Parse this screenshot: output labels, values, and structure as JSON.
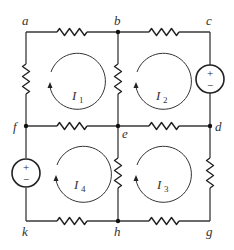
{
  "diagram": {
    "type": "circuit-mesh",
    "nodes": {
      "a": {
        "label": "a",
        "x": 26,
        "y": 32
      },
      "b": {
        "label": "b",
        "x": 118,
        "y": 32
      },
      "c": {
        "label": "c",
        "x": 210,
        "y": 32
      },
      "d": {
        "label": "d",
        "x": 210,
        "y": 126
      },
      "e": {
        "label": "e",
        "x": 118,
        "y": 126
      },
      "f": {
        "label": "f",
        "x": 26,
        "y": 126
      },
      "g": {
        "label": "g",
        "x": 210,
        "y": 221
      },
      "h": {
        "label": "h",
        "x": 118,
        "y": 221
      },
      "k": {
        "label": "k",
        "x": 26,
        "y": 221
      }
    },
    "junction_dots": [
      "b",
      "d",
      "e",
      "f",
      "h"
    ],
    "resistors": [
      {
        "between": "a-b"
      },
      {
        "between": "b-c"
      },
      {
        "between": "a-f"
      },
      {
        "between": "b-e"
      },
      {
        "between": "f-e"
      },
      {
        "between": "e-d"
      },
      {
        "between": "e-h"
      },
      {
        "between": "d-g"
      },
      {
        "between": "k-h"
      },
      {
        "between": "h-g"
      }
    ],
    "sources": [
      {
        "between": "c-d",
        "plus": "+",
        "minus": "−",
        "plus_side": "c"
      },
      {
        "between": "f-k",
        "plus": "+",
        "minus": "−",
        "plus_side": "f"
      }
    ],
    "mesh_currents": [
      {
        "name": "I",
        "sub": "1",
        "direction": "clockwise"
      },
      {
        "name": "I",
        "sub": "2",
        "direction": "clockwise"
      },
      {
        "name": "I",
        "sub": "3",
        "direction": "clockwise"
      },
      {
        "name": "I",
        "sub": "4",
        "direction": "clockwise"
      }
    ]
  }
}
